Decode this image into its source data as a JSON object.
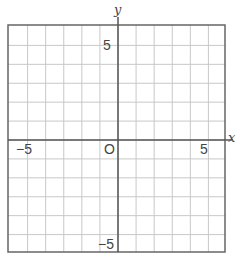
{
  "chart_data": {
    "type": "line",
    "title": "",
    "xlabel": "x",
    "ylabel": "y",
    "xlim": [
      -6,
      6
    ],
    "ylim": [
      -6,
      6
    ],
    "grid": true,
    "grid_step": 1,
    "series": [],
    "tick_labels": {
      "x": [
        {
          "value": -5,
          "label": "−5"
        },
        {
          "value": 5,
          "label": "5"
        }
      ],
      "y": [
        {
          "value": 5,
          "label": "5"
        },
        {
          "value": -5,
          "label": "−5"
        }
      ]
    },
    "origin_label": "O"
  },
  "colors": {
    "grid": "#c8c8c8",
    "axis": "#555555",
    "border": "#666666",
    "text": "#444444"
  },
  "labels": {
    "x_axis": "x",
    "y_axis": "y",
    "origin": "O",
    "x_neg5": "−5",
    "x_pos5": "5",
    "y_pos5": "5",
    "y_neg5": "−5"
  }
}
